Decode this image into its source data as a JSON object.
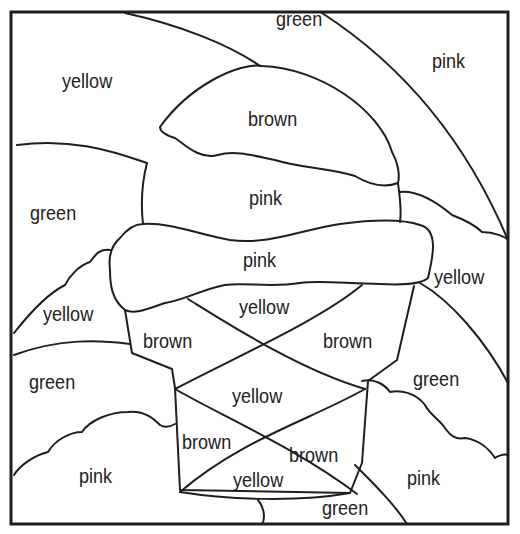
{
  "regions": [
    {
      "id": "sky-top-left",
      "label": "yellow",
      "x": 62,
      "y": 70
    },
    {
      "id": "arc-top",
      "label": "green",
      "x": 276,
      "y": 8
    },
    {
      "id": "sky-top-right",
      "label": "pink",
      "x": 432,
      "y": 50
    },
    {
      "id": "scoop-top",
      "label": "brown",
      "x": 248,
      "y": 108
    },
    {
      "id": "scoop-middle",
      "label": "pink",
      "x": 249,
      "y": 187
    },
    {
      "id": "arc-left",
      "label": "green",
      "x": 30,
      "y": 202
    },
    {
      "id": "scoop-bottom",
      "label": "pink",
      "x": 243,
      "y": 249
    },
    {
      "id": "cloud-right-top",
      "label": "yellow",
      "x": 434,
      "y": 266
    },
    {
      "id": "cloud-left-top",
      "label": "yellow",
      "x": 43,
      "y": 303
    },
    {
      "id": "cone-upper-center",
      "label": "yellow",
      "x": 239,
      "y": 296
    },
    {
      "id": "cone-upper-left",
      "label": "brown",
      "x": 143,
      "y": 330
    },
    {
      "id": "cone-upper-right",
      "label": "brown",
      "x": 323,
      "y": 330
    },
    {
      "id": "arc-lower-left",
      "label": "green",
      "x": 29,
      "y": 371
    },
    {
      "id": "arc-lower-right",
      "label": "green",
      "x": 413,
      "y": 368
    },
    {
      "id": "cone-middle-center",
      "label": "yellow",
      "x": 232,
      "y": 385
    },
    {
      "id": "cone-lower-left",
      "label": "brown",
      "x": 182,
      "y": 431
    },
    {
      "id": "cone-lower-right",
      "label": "brown",
      "x": 289,
      "y": 444
    },
    {
      "id": "cloud-bottom-left",
      "label": "pink",
      "x": 79,
      "y": 465
    },
    {
      "id": "cloud-bottom-right",
      "label": "pink",
      "x": 407,
      "y": 467
    },
    {
      "id": "cone-bottom-center",
      "label": "yellow",
      "x": 233,
      "y": 469
    },
    {
      "id": "arc-bottom",
      "label": "green",
      "x": 322,
      "y": 497
    }
  ]
}
